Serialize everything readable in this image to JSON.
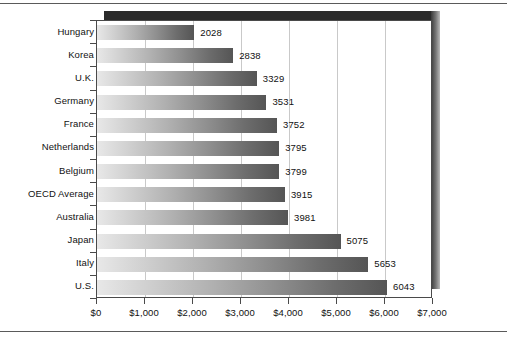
{
  "chart_data": {
    "type": "bar",
    "orientation": "horizontal",
    "title": "",
    "subtitle": "",
    "xlabel": "",
    "ylabel": "",
    "categories": [
      "Hungary",
      "Korea",
      "U.K.",
      "Germany",
      "France",
      "Netherlands",
      "Belgium",
      "OECD Average",
      "Australia",
      "Japan",
      "Italy",
      "U.S."
    ],
    "values": [
      2028,
      2838,
      3329,
      3531,
      3752,
      3795,
      3799,
      3915,
      3981,
      5075,
      5653,
      6043
    ],
    "data_labels": [
      "2028",
      "2838",
      "3329",
      "3531",
      "3752",
      "3795",
      "3799",
      "3915",
      "3981",
      "5075",
      "5653",
      "6043"
    ],
    "xlim": [
      0,
      7000
    ],
    "x_tick_values": [
      0,
      1000,
      2000,
      3000,
      4000,
      5000,
      6000,
      7000
    ],
    "x_tick_labels": [
      "$0",
      "$1,000",
      "$2,000",
      "$3,000",
      "$4,000",
      "$5,000",
      "$6,000",
      "$7,000"
    ],
    "grid": "vertical",
    "legend": "none",
    "bar_fill": "gradient-light-to-dark-gray",
    "colors": {
      "bar_start": "#e8e8e8",
      "bar_end": "#555555",
      "gridline": "#c9c9c9",
      "axis": "#4a4a4a",
      "shadow": "#2b2b2b",
      "text": "#111111",
      "background": "#ffffff"
    }
  }
}
